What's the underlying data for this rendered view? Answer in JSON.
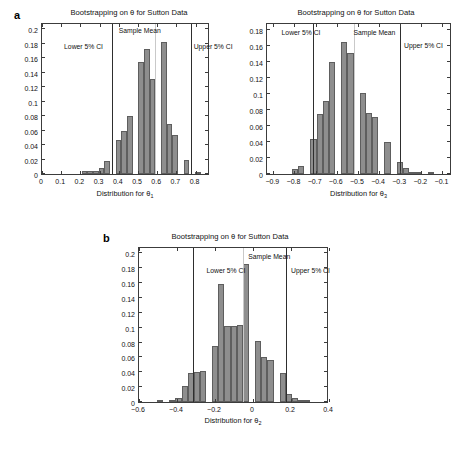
{
  "figure": {
    "panels": [
      {
        "letter": "a",
        "show_letter": true
      },
      {
        "letter": "",
        "show_letter": false
      },
      {
        "letter": "b",
        "show_letter": true
      }
    ]
  },
  "annotations": {
    "lower_ci": "Lower 5% CI",
    "sample_mean": "Sample Mean",
    "upper_ci": "Upper 5% CI"
  },
  "chart_data": [
    {
      "id": "theta1",
      "type": "bar",
      "title": "Bootstrapping on θ for Sutton Data",
      "xlabel_prefix": "Distribution for θ",
      "xlabel_sub": "1",
      "ylabel": "",
      "xlim": [
        0,
        0.875
      ],
      "ylim": [
        0,
        0.21
      ],
      "xticks": [
        0,
        0.1,
        0.2,
        0.3,
        0.4,
        0.5,
        0.6,
        0.7,
        0.8
      ],
      "xtick_labels": [
        "0",
        "0.1",
        "0.2",
        "0.3",
        "0.4",
        "0.5",
        "0.6",
        "0.7",
        "0.8"
      ],
      "yticks": [
        0,
        0.02,
        0.04,
        0.06,
        0.08,
        0.1,
        0.12,
        0.14,
        0.16,
        0.18,
        0.2
      ],
      "ytick_labels": [
        "0",
        "0.02",
        "0.04",
        "0.06",
        "0.08",
        "0.1",
        "0.12",
        "0.14",
        "0.16",
        "0.18",
        "0.2"
      ],
      "bin_width": 0.0295,
      "bin_lefts": [
        0.0885,
        0.118,
        0.1475,
        0.177,
        0.2065,
        0.236,
        0.2655,
        0.295,
        0.3245,
        0.354,
        0.3835,
        0.413,
        0.4425,
        0.472,
        0.5015,
        0.531,
        0.5605,
        0.59,
        0.6195,
        0.649,
        0.6785,
        0.708,
        0.7375,
        0.767,
        0.7965,
        0.826
      ],
      "values": [
        0.0,
        0.0,
        0.0,
        0.0,
        0.0038,
        0.0038,
        0.0038,
        0.0083,
        0.0175,
        0.0,
        0.0472,
        0.0597,
        0.0805,
        0.0,
        0.1552,
        0.1729,
        0.1313,
        0.0,
        0.1822,
        0.0695,
        0.0536,
        0.0,
        0.0188,
        0.0,
        0.003,
        0.0
      ],
      "lines": [
        {
          "name": "lower_ci",
          "x": 0.3655,
          "style": "dark"
        },
        {
          "name": "sample_mean",
          "x": 0.5905,
          "style": "light"
        },
        {
          "name": "upper_ci",
          "x": 0.7755,
          "style": "dark"
        }
      ],
      "label_positions": {
        "lower_ci": 0.115,
        "sample_mean": 0.4,
        "upper_ci": 0.79
      },
      "label_y": {
        "lower_ci": 0.172,
        "sample_mean": 0.194,
        "upper_ci": 0.172
      }
    },
    {
      "id": "theta3",
      "type": "bar",
      "title": "Bootstrapping on θ for Sutton Data",
      "xlabel_prefix": "Distribution for θ",
      "xlabel_sub": "3",
      "ylabel": "",
      "xlim": [
        -0.93,
        -0.055
      ],
      "ylim": [
        0,
        0.19
      ],
      "xticks": [
        -0.9,
        -0.8,
        -0.7,
        -0.6,
        -0.5,
        -0.4,
        -0.3,
        -0.2,
        -0.1
      ],
      "xtick_labels": [
        "−0.9",
        "−0.8",
        "−0.7",
        "−0.6",
        "−0.5",
        "−0.4",
        "−0.3",
        "−0.2",
        "−0.1"
      ],
      "yticks": [
        0,
        0.02,
        0.04,
        0.06,
        0.08,
        0.1,
        0.12,
        0.14,
        0.16,
        0.18
      ],
      "ytick_labels": [
        "0",
        "0.02",
        "0.04",
        "0.06",
        "0.08",
        "0.1",
        "0.12",
        "0.14",
        "0.16",
        "0.18"
      ],
      "bin_width": 0.0292,
      "bin_lefts": [
        -0.9,
        -0.8708,
        -0.8416,
        -0.8124,
        -0.7832,
        -0.754,
        -0.7248,
        -0.6956,
        -0.6664,
        -0.6372,
        -0.608,
        -0.5788,
        -0.5496,
        -0.5204,
        -0.4912,
        -0.462,
        -0.4328,
        -0.4036,
        -0.3744,
        -0.3452,
        -0.316,
        -0.2868,
        -0.2576,
        -0.2284,
        -0.1992,
        -0.17,
        -0.1408,
        -0.1116
      ],
      "values": [
        0.0,
        0.0,
        0.0,
        0.0058,
        0.0095,
        0.0,
        0.0432,
        0.0752,
        0.0918,
        0.1403,
        0.0,
        0.1648,
        0.1512,
        0.0,
        0.1008,
        0.0765,
        0.0712,
        0.0,
        0.0403,
        0.0,
        0.0148,
        0.0072,
        0.0022,
        0.0022,
        0.0,
        0.0011,
        0.0,
        0.0
      ],
      "lines": [
        {
          "name": "lower_ci",
          "x": -0.7145,
          "style": "dark"
        },
        {
          "name": "sample_mean",
          "x": -0.5205,
          "style": "light"
        },
        {
          "name": "upper_ci",
          "x": -0.3015,
          "style": "dark"
        }
      ],
      "label_positions": {
        "lower_ci": -0.861,
        "sample_mean": -0.521,
        "upper_ci": -0.282
      },
      "label_y": {
        "lower_ci": 0.173,
        "sample_mean": 0.173,
        "upper_ci": 0.156
      }
    },
    {
      "id": "theta2",
      "type": "bar",
      "title": "Bootstrapping on θ for Sutton Data",
      "xlabel_prefix": "Distribution for θ",
      "xlabel_sub": "2",
      "ylabel": "",
      "xlim": [
        -0.6,
        0.4
      ],
      "ylim": [
        0,
        0.21
      ],
      "xticks": [
        -0.6,
        -0.4,
        -0.2,
        0,
        0.2,
        0.4
      ],
      "xtick_labels": [
        "−0.6",
        "−0.4",
        "−0.2",
        "0",
        "0.2",
        "0.4"
      ],
      "yticks": [
        0,
        0.02,
        0.04,
        0.06,
        0.08,
        0.1,
        0.12,
        0.14,
        0.16,
        0.18,
        0.2
      ],
      "ytick_labels": [
        "0",
        "0.02",
        "0.04",
        "0.06",
        "0.08",
        "0.1",
        "0.12",
        "0.14",
        "0.16",
        "0.18",
        "0.2"
      ],
      "bin_width": 0.0323,
      "bin_lefts": [
        -0.57,
        -0.5377,
        -0.5054,
        -0.4731,
        -0.4408,
        -0.4085,
        -0.3762,
        -0.3439,
        -0.3116,
        -0.2793,
        -0.247,
        -0.2147,
        -0.1824,
        -0.1501,
        -0.1178,
        -0.0855,
        -0.0532,
        -0.0209,
        0.0114,
        0.0437,
        0.076,
        0.1083,
        0.1406,
        0.1729,
        0.2052,
        0.2375,
        0.2698,
        0.3021,
        0.3344
      ],
      "values": [
        0.0,
        0.0,
        0.0011,
        0.0,
        0.0028,
        0.0055,
        0.0215,
        0.0397,
        0.0408,
        0.0418,
        0.0,
        0.0752,
        0.1592,
        0.1025,
        0.1022,
        0.1037,
        0.1855,
        0.0,
        0.0815,
        0.0608,
        0.0563,
        0.0,
        0.0397,
        0.0113,
        0.0055,
        0.0033,
        0.0011,
        0.0,
        0.0
      ],
      "lines": [
        {
          "name": "lower_ci",
          "x": -0.315,
          "style": "dark"
        },
        {
          "name": "sample_mean",
          "x": -0.052,
          "style": "light"
        },
        {
          "name": "upper_ci",
          "x": 0.174,
          "style": "dark"
        }
      ],
      "label_positions": {
        "lower_ci": -0.245,
        "sample_mean": -0.025,
        "upper_ci": 0.2
      },
      "label_y": {
        "lower_ci": 0.172,
        "sample_mean": 0.191,
        "upper_ci": 0.172
      }
    }
  ]
}
